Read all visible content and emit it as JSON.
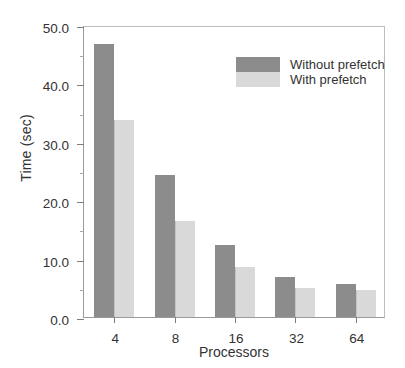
{
  "chart_data": {
    "type": "bar",
    "title": "",
    "xlabel": "Processors",
    "ylabel": "Time (sec)",
    "categories": [
      "4",
      "8",
      "16",
      "32",
      "64"
    ],
    "series": [
      {
        "name": "Without prefetch",
        "color": "#8c8c8c",
        "values": [
          46.8,
          24.3,
          12.3,
          6.8,
          5.7
        ]
      },
      {
        "name": "With prefetch",
        "color": "#d9d9d9",
        "values": [
          33.7,
          16.5,
          8.6,
          5.0,
          4.6
        ]
      }
    ],
    "ylim": [
      0.0,
      50.0
    ],
    "ytick_labels": [
      "0.0",
      "10.0",
      "20.0",
      "30.0",
      "40.0",
      "50.0"
    ],
    "ytick_values": [
      0,
      10,
      20,
      30,
      40,
      50
    ],
    "yminor_values": [
      5,
      15,
      25,
      35,
      45
    ],
    "xtick_labels": [
      "4",
      "8",
      "16",
      "32",
      "64"
    ],
    "grid": false,
    "legend_position": "upper right"
  }
}
